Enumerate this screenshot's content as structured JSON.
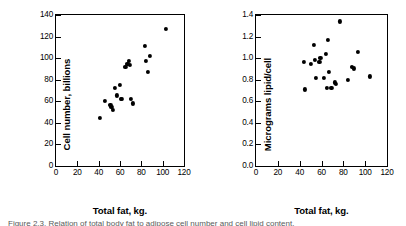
{
  "figure": {
    "caption": "Figure 2.3.  Relation of total body fat to adipose cell number and cell lipid content."
  },
  "chart_data": [
    {
      "id": "left",
      "type": "scatter",
      "title": "",
      "xlabel": "Total fat, kg.",
      "ylabel": "Cell number, billions",
      "xlim": [
        0,
        120
      ],
      "ylim": [
        0,
        140
      ],
      "xticks": [
        0,
        20,
        40,
        60,
        80,
        100,
        120
      ],
      "yticks": [
        0,
        20,
        40,
        60,
        80,
        100,
        120,
        140
      ],
      "grid": false,
      "legend": "none",
      "marker": "filled-circle",
      "marker_color": "#000000",
      "points": [
        {
          "x": 41,
          "y": 44.5
        },
        {
          "x": 46,
          "y": 60.5
        },
        {
          "x": 51,
          "y": 57.0
        },
        {
          "x": 52,
          "y": 54.5
        },
        {
          "x": 53,
          "y": 52.0
        },
        {
          "x": 55,
          "y": 72.5
        },
        {
          "x": 57,
          "y": 65.5
        },
        {
          "x": 60,
          "y": 75.0
        },
        {
          "x": 61,
          "y": 62.5
        },
        {
          "x": 62,
          "y": 62.0
        },
        {
          "x": 65,
          "y": 91.5
        },
        {
          "x": 67,
          "y": 95.0
        },
        {
          "x": 68,
          "y": 97.5
        },
        {
          "x": 69,
          "y": 93.5
        },
        {
          "x": 70,
          "y": 62.5
        },
        {
          "x": 72,
          "y": 58.0
        },
        {
          "x": 83,
          "y": 111.0
        },
        {
          "x": 84,
          "y": 97.5
        },
        {
          "x": 86,
          "y": 87.0
        },
        {
          "x": 88,
          "y": 102.0
        },
        {
          "x": 103,
          "y": 127.0
        }
      ]
    },
    {
      "id": "right",
      "type": "scatter",
      "title": "",
      "xlabel": "Total fat, kg.",
      "ylabel": "Micrograms lipid/cell",
      "xlim": [
        0,
        120
      ],
      "ylim": [
        0,
        1.4
      ],
      "xticks": [
        0,
        20,
        40,
        60,
        80,
        100,
        120
      ],
      "yticks": [
        0,
        0.2,
        0.4,
        0.6,
        0.8,
        1.0,
        1.2,
        1.4
      ],
      "grid": false,
      "legend": "none",
      "marker": "filled-circle",
      "marker_color": "#000000",
      "points": [
        {
          "x": 44,
          "y": 0.965
        },
        {
          "x": 45,
          "y": 0.71
        },
        {
          "x": 50,
          "y": 0.945
        },
        {
          "x": 53,
          "y": 1.12
        },
        {
          "x": 54,
          "y": 0.985
        },
        {
          "x": 55,
          "y": 0.82
        },
        {
          "x": 58,
          "y": 0.965
        },
        {
          "x": 59,
          "y": 1.0
        },
        {
          "x": 62,
          "y": 0.815
        },
        {
          "x": 64,
          "y": 1.04
        },
        {
          "x": 65,
          "y": 0.725
        },
        {
          "x": 66,
          "y": 1.17
        },
        {
          "x": 67,
          "y": 0.87
        },
        {
          "x": 69,
          "y": 0.725
        },
        {
          "x": 72,
          "y": 0.775
        },
        {
          "x": 73,
          "y": 0.76
        },
        {
          "x": 77,
          "y": 1.34
        },
        {
          "x": 84,
          "y": 0.8
        },
        {
          "x": 88,
          "y": 0.915
        },
        {
          "x": 90,
          "y": 0.905
        },
        {
          "x": 93,
          "y": 1.06
        },
        {
          "x": 104,
          "y": 0.83
        }
      ]
    }
  ]
}
